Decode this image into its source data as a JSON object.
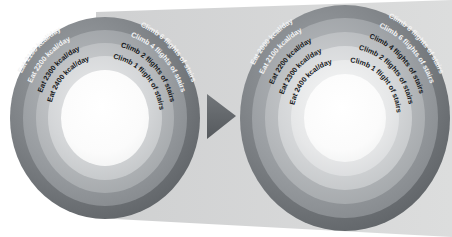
{
  "diagram": {
    "type": "concentric-ring-target-pair",
    "background_shape": "trapezoid-banner",
    "colors": {
      "banner": "#d6d7d8",
      "ring_outer_dark": "#6f7478",
      "ring_dark": "#85898d",
      "ring_mid": "#9fa3a6",
      "ring_light": "#c2c5c7",
      "ring_lighter": "#dcdedf",
      "core": "#fcfcfc",
      "arrow": "#63676b",
      "text_dark": "#16181a",
      "text_light": "#f2f3f4"
    },
    "arrow": {
      "name": "progression-arrow",
      "direction": "right"
    },
    "targets": [
      {
        "id": "left-target",
        "name": "initial-goal-target",
        "rings": 4,
        "eat_labels": [
          "Eat 2100 kcal/day",
          "Eat 2200 kcal/day",
          "Eat 2300 kcal/day",
          "Eat 2400 kcal/day"
        ],
        "climb_labels": [
          "Climb 6 flights of stairs",
          "Climb 4 flights of stairs",
          "Climb 2 flights of stairs",
          "Climb 1 flight of stairs"
        ]
      },
      {
        "id": "right-target",
        "name": "escalated-goal-target",
        "rings": 5,
        "eat_labels": [
          "Eat 2000 kcal/day",
          "Eat 2100 kcal/day",
          "Eat 2200 kcal/day",
          "Eat 2300 kcal/day",
          "Eat 2400 kcal/day"
        ],
        "climb_labels": [
          "Climb 8 flights of stairs",
          "Climb 6 flights of stairs",
          "Climb 4 flights of stairs",
          "Climb 2 flights of stairs",
          "Climb 1 flight of stairs"
        ]
      }
    ]
  }
}
